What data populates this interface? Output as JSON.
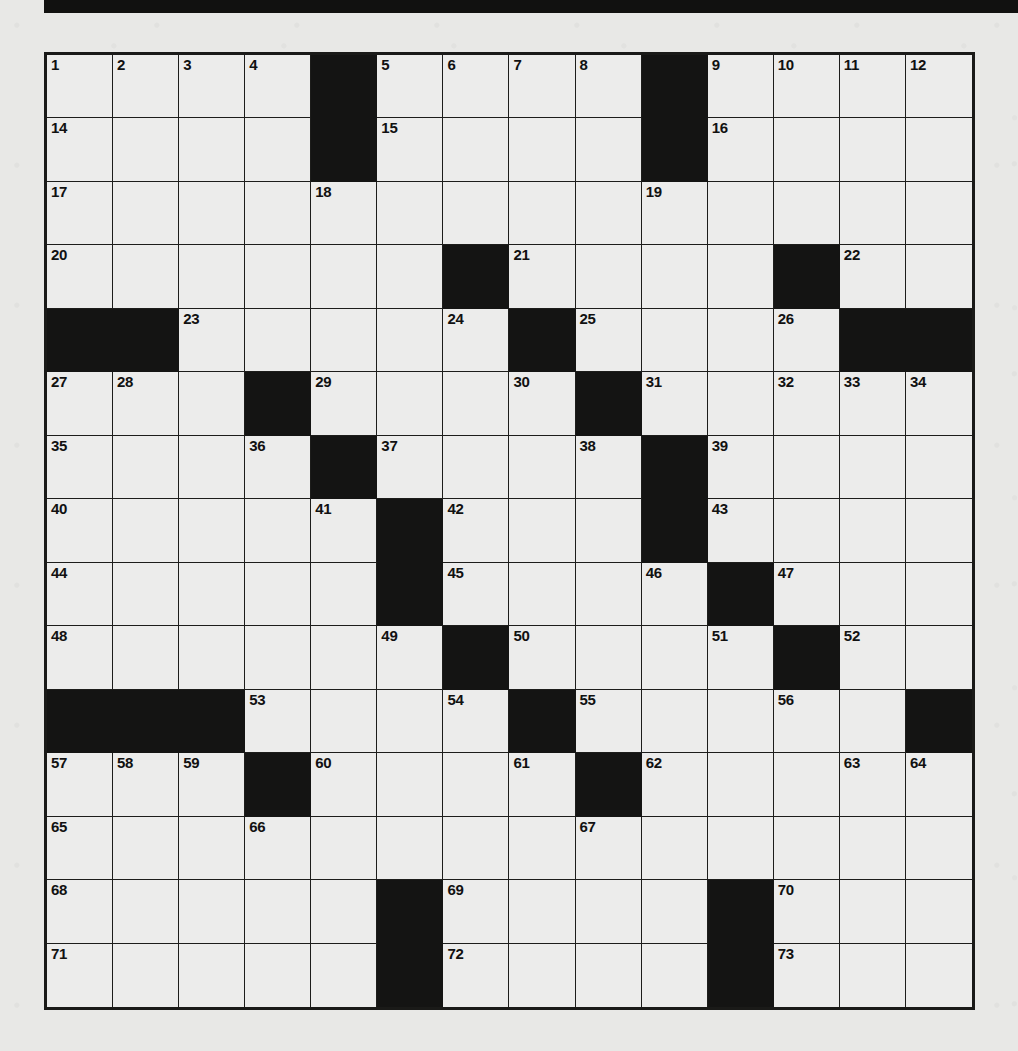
{
  "page": {
    "kind": "crossword-puzzle-grid",
    "background_color": "#e8e8e6",
    "ink_color": "#141413",
    "cell_fill_color": "#ececeb"
  },
  "masthead": {
    "name": "masthead-bar",
    "color": "#111110"
  },
  "grid": {
    "columns": 14,
    "rows": 15,
    "total_cells": 210,
    "black_square_count": 44,
    "highest_clue_number": 73,
    "rows_data": [
      {
        "index": 1,
        "cells": [
          {
            "black": false,
            "number": "1"
          },
          {
            "black": false,
            "number": "2"
          },
          {
            "black": false,
            "number": "3"
          },
          {
            "black": false,
            "number": "4"
          },
          {
            "black": true,
            "number": ""
          },
          {
            "black": false,
            "number": "5"
          },
          {
            "black": false,
            "number": "6"
          },
          {
            "black": false,
            "number": "7"
          },
          {
            "black": false,
            "number": "8"
          },
          {
            "black": true,
            "number": ""
          },
          {
            "black": false,
            "number": "9"
          },
          {
            "black": false,
            "number": "10"
          },
          {
            "black": false,
            "number": "11"
          },
          {
            "black": false,
            "number": "12"
          }
        ]
      },
      {
        "index": 2,
        "cells": [
          {
            "black": false,
            "number": "14"
          },
          {
            "black": false,
            "number": ""
          },
          {
            "black": false,
            "number": ""
          },
          {
            "black": false,
            "number": ""
          },
          {
            "black": true,
            "number": ""
          },
          {
            "black": false,
            "number": "15"
          },
          {
            "black": false,
            "number": ""
          },
          {
            "black": false,
            "number": ""
          },
          {
            "black": false,
            "number": ""
          },
          {
            "black": true,
            "number": ""
          },
          {
            "black": false,
            "number": "16"
          },
          {
            "black": false,
            "number": ""
          },
          {
            "black": false,
            "number": ""
          },
          {
            "black": false,
            "number": ""
          }
        ]
      },
      {
        "index": 3,
        "cells": [
          {
            "black": false,
            "number": "17"
          },
          {
            "black": false,
            "number": ""
          },
          {
            "black": false,
            "number": ""
          },
          {
            "black": false,
            "number": ""
          },
          {
            "black": false,
            "number": "18"
          },
          {
            "black": false,
            "number": ""
          },
          {
            "black": false,
            "number": ""
          },
          {
            "black": false,
            "number": ""
          },
          {
            "black": false,
            "number": ""
          },
          {
            "black": false,
            "number": "19"
          },
          {
            "black": false,
            "number": ""
          },
          {
            "black": false,
            "number": ""
          },
          {
            "black": false,
            "number": ""
          },
          {
            "black": false,
            "number": ""
          }
        ]
      },
      {
        "index": 4,
        "cells": [
          {
            "black": false,
            "number": "20"
          },
          {
            "black": false,
            "number": ""
          },
          {
            "black": false,
            "number": ""
          },
          {
            "black": false,
            "number": ""
          },
          {
            "black": false,
            "number": ""
          },
          {
            "black": false,
            "number": ""
          },
          {
            "black": true,
            "number": ""
          },
          {
            "black": false,
            "number": "21"
          },
          {
            "black": false,
            "number": ""
          },
          {
            "black": false,
            "number": ""
          },
          {
            "black": false,
            "number": ""
          },
          {
            "black": true,
            "number": ""
          },
          {
            "black": false,
            "number": "22"
          },
          {
            "black": false,
            "number": ""
          }
        ]
      },
      {
        "index": 5,
        "cells": [
          {
            "black": true,
            "number": ""
          },
          {
            "black": true,
            "number": ""
          },
          {
            "black": false,
            "number": "23"
          },
          {
            "black": false,
            "number": ""
          },
          {
            "black": false,
            "number": ""
          },
          {
            "black": false,
            "number": ""
          },
          {
            "black": false,
            "number": "24"
          },
          {
            "black": true,
            "number": ""
          },
          {
            "black": false,
            "number": "25"
          },
          {
            "black": false,
            "number": ""
          },
          {
            "black": false,
            "number": ""
          },
          {
            "black": false,
            "number": "26"
          },
          {
            "black": true,
            "number": ""
          },
          {
            "black": true,
            "number": ""
          }
        ]
      },
      {
        "index": 6,
        "cells": [
          {
            "black": false,
            "number": "27"
          },
          {
            "black": false,
            "number": "28"
          },
          {
            "black": false,
            "number": ""
          },
          {
            "black": true,
            "number": ""
          },
          {
            "black": false,
            "number": "29"
          },
          {
            "black": false,
            "number": ""
          },
          {
            "black": false,
            "number": ""
          },
          {
            "black": false,
            "number": "30"
          },
          {
            "black": true,
            "number": ""
          },
          {
            "black": false,
            "number": "31"
          },
          {
            "black": false,
            "number": ""
          },
          {
            "black": false,
            "number": "32"
          },
          {
            "black": false,
            "number": "33"
          },
          {
            "black": false,
            "number": "34"
          }
        ]
      },
      {
        "index": 7,
        "cells": [
          {
            "black": false,
            "number": "35"
          },
          {
            "black": false,
            "number": ""
          },
          {
            "black": false,
            "number": ""
          },
          {
            "black": false,
            "number": "36"
          },
          {
            "black": true,
            "number": ""
          },
          {
            "black": false,
            "number": "37"
          },
          {
            "black": false,
            "number": ""
          },
          {
            "black": false,
            "number": ""
          },
          {
            "black": false,
            "number": "38"
          },
          {
            "black": true,
            "number": ""
          },
          {
            "black": false,
            "number": "39"
          },
          {
            "black": false,
            "number": ""
          },
          {
            "black": false,
            "number": ""
          },
          {
            "black": false,
            "number": ""
          }
        ]
      },
      {
        "index": 8,
        "cells": [
          {
            "black": false,
            "number": "40"
          },
          {
            "black": false,
            "number": ""
          },
          {
            "black": false,
            "number": ""
          },
          {
            "black": false,
            "number": ""
          },
          {
            "black": false,
            "number": "41"
          },
          {
            "black": true,
            "number": ""
          },
          {
            "black": false,
            "number": "42"
          },
          {
            "black": false,
            "number": ""
          },
          {
            "black": false,
            "number": ""
          },
          {
            "black": true,
            "number": ""
          },
          {
            "black": false,
            "number": "43"
          },
          {
            "black": false,
            "number": ""
          },
          {
            "black": false,
            "number": ""
          },
          {
            "black": false,
            "number": ""
          }
        ]
      },
      {
        "index": 9,
        "cells": [
          {
            "black": false,
            "number": "44"
          },
          {
            "black": false,
            "number": ""
          },
          {
            "black": false,
            "number": ""
          },
          {
            "black": false,
            "number": ""
          },
          {
            "black": false,
            "number": ""
          },
          {
            "black": true,
            "number": ""
          },
          {
            "black": false,
            "number": "45"
          },
          {
            "black": false,
            "number": ""
          },
          {
            "black": false,
            "number": ""
          },
          {
            "black": false,
            "number": "46"
          },
          {
            "black": true,
            "number": ""
          },
          {
            "black": false,
            "number": "47"
          },
          {
            "black": false,
            "number": ""
          },
          {
            "black": false,
            "number": ""
          }
        ]
      },
      {
        "index": 10,
        "cells": [
          {
            "black": false,
            "number": "48"
          },
          {
            "black": false,
            "number": ""
          },
          {
            "black": false,
            "number": ""
          },
          {
            "black": false,
            "number": ""
          },
          {
            "black": false,
            "number": ""
          },
          {
            "black": false,
            "number": "49"
          },
          {
            "black": true,
            "number": ""
          },
          {
            "black": false,
            "number": "50"
          },
          {
            "black": false,
            "number": ""
          },
          {
            "black": false,
            "number": ""
          },
          {
            "black": false,
            "number": "51"
          },
          {
            "black": true,
            "number": ""
          },
          {
            "black": false,
            "number": "52"
          },
          {
            "black": false,
            "number": ""
          }
        ]
      },
      {
        "index": 11,
        "cells": [
          {
            "black": true,
            "number": ""
          },
          {
            "black": true,
            "number": ""
          },
          {
            "black": true,
            "number": ""
          },
          {
            "black": false,
            "number": "53"
          },
          {
            "black": false,
            "number": ""
          },
          {
            "black": false,
            "number": ""
          },
          {
            "black": false,
            "number": "54"
          },
          {
            "black": true,
            "number": ""
          },
          {
            "black": false,
            "number": "55"
          },
          {
            "black": false,
            "number": ""
          },
          {
            "black": false,
            "number": ""
          },
          {
            "black": false,
            "number": "56"
          },
          {
            "black": false,
            "number": ""
          },
          {
            "black": true,
            "number": ""
          }
        ]
      },
      {
        "index": 12,
        "cells": [
          {
            "black": false,
            "number": "57"
          },
          {
            "black": false,
            "number": "58"
          },
          {
            "black": false,
            "number": "59"
          },
          {
            "black": true,
            "number": ""
          },
          {
            "black": false,
            "number": "60"
          },
          {
            "black": false,
            "number": ""
          },
          {
            "black": false,
            "number": ""
          },
          {
            "black": false,
            "number": "61"
          },
          {
            "black": true,
            "number": ""
          },
          {
            "black": false,
            "number": "62"
          },
          {
            "black": false,
            "number": ""
          },
          {
            "black": false,
            "number": ""
          },
          {
            "black": false,
            "number": "63"
          },
          {
            "black": false,
            "number": "64"
          }
        ]
      },
      {
        "index": 13,
        "cells": [
          {
            "black": false,
            "number": "65"
          },
          {
            "black": false,
            "number": ""
          },
          {
            "black": false,
            "number": ""
          },
          {
            "black": false,
            "number": "66"
          },
          {
            "black": false,
            "number": ""
          },
          {
            "black": false,
            "number": ""
          },
          {
            "black": false,
            "number": ""
          },
          {
            "black": false,
            "number": ""
          },
          {
            "black": false,
            "number": "67"
          },
          {
            "black": false,
            "number": ""
          },
          {
            "black": false,
            "number": ""
          },
          {
            "black": false,
            "number": ""
          },
          {
            "black": false,
            "number": ""
          },
          {
            "black": false,
            "number": ""
          }
        ]
      },
      {
        "index": 14,
        "cells": [
          {
            "black": false,
            "number": "68"
          },
          {
            "black": false,
            "number": ""
          },
          {
            "black": false,
            "number": ""
          },
          {
            "black": false,
            "number": ""
          },
          {
            "black": false,
            "number": ""
          },
          {
            "black": true,
            "number": ""
          },
          {
            "black": false,
            "number": "69"
          },
          {
            "black": false,
            "number": ""
          },
          {
            "black": false,
            "number": ""
          },
          {
            "black": false,
            "number": ""
          },
          {
            "black": true,
            "number": ""
          },
          {
            "black": false,
            "number": "70"
          },
          {
            "black": false,
            "number": ""
          },
          {
            "black": false,
            "number": ""
          }
        ]
      },
      {
        "index": 15,
        "cells": [
          {
            "black": false,
            "number": "71"
          },
          {
            "black": false,
            "number": ""
          },
          {
            "black": false,
            "number": ""
          },
          {
            "black": false,
            "number": ""
          },
          {
            "black": false,
            "number": ""
          },
          {
            "black": true,
            "number": ""
          },
          {
            "black": false,
            "number": "72"
          },
          {
            "black": false,
            "number": ""
          },
          {
            "black": false,
            "number": ""
          },
          {
            "black": false,
            "number": ""
          },
          {
            "black": true,
            "number": ""
          },
          {
            "black": false,
            "number": "73"
          },
          {
            "black": false,
            "number": ""
          },
          {
            "black": false,
            "number": ""
          }
        ]
      }
    ]
  }
}
